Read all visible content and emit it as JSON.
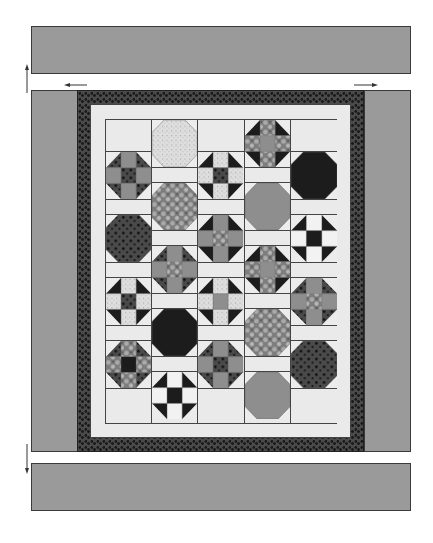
{
  "diagram": {
    "type": "quilt-assembly",
    "colors": {
      "outer_border": "#9a9a9a",
      "dark_border": "#4a4a4a",
      "light_background": "#eaeaea",
      "black": "#1c1c1c",
      "gray": "#8e8e8e",
      "speckle": "#dedede",
      "dotted": "#4a4a4a",
      "floral": "#7d7d7d",
      "line": "#444444"
    },
    "arrows": [
      {
        "name": "arrow-up-left",
        "direction": "up"
      },
      {
        "name": "arrow-left-top",
        "direction": "left"
      },
      {
        "name": "arrow-right-top",
        "direction": "right"
      },
      {
        "name": "arrow-down-left",
        "direction": "down"
      }
    ],
    "columns": [
      {
        "offset": "half",
        "blocks": [
          {
            "type": "shoofly",
            "corners": "dotted",
            "sides": "gray",
            "center": "dotted"
          },
          {
            "type": "octagon",
            "fill": "dotted"
          },
          {
            "type": "shoofly",
            "corners": "black",
            "sides": "speckle",
            "center": "dotted"
          },
          {
            "type": "shoofly",
            "corners": "dotted",
            "sides": "floral",
            "center": "black"
          }
        ]
      },
      {
        "offset": "full",
        "blocks": [
          {
            "type": "octagon",
            "fill": "speckle"
          },
          {
            "type": "octagon",
            "fill": "floral"
          },
          {
            "type": "shoofly",
            "corners": "dotted",
            "sides": "gray",
            "center": "floral"
          },
          {
            "type": "octagon",
            "fill": "black"
          },
          {
            "type": "shoofly",
            "corners": "black",
            "sides": "white",
            "center": "black"
          }
        ]
      },
      {
        "offset": "half",
        "blocks": [
          {
            "type": "shoofly",
            "corners": "black",
            "sides": "speckle",
            "center": "dotted"
          },
          {
            "type": "shoofly",
            "corners": "black",
            "sides": "gray",
            "center": "floral"
          },
          {
            "type": "shoofly",
            "corners": "black",
            "sides": "speckle",
            "center": "gray"
          },
          {
            "type": "shoofly",
            "corners": "dotted",
            "sides": "gray",
            "center": "dotted"
          }
        ]
      },
      {
        "offset": "full",
        "blocks": [
          {
            "type": "shoofly",
            "corners": "black",
            "sides": "floral",
            "center": "gray"
          },
          {
            "type": "octagon",
            "fill": "gray"
          },
          {
            "type": "shoofly",
            "corners": "black",
            "sides": "floral",
            "center": "gray"
          },
          {
            "type": "octagon",
            "fill": "floral"
          },
          {
            "type": "octagon",
            "fill": "gray"
          }
        ]
      },
      {
        "offset": "half",
        "blocks": [
          {
            "type": "octagon",
            "fill": "black"
          },
          {
            "type": "shoofly",
            "corners": "black",
            "sides": "white",
            "center": "black"
          },
          {
            "type": "shoofly",
            "corners": "dotted",
            "sides": "gray",
            "center": "floral"
          },
          {
            "type": "octagon",
            "fill": "dotted"
          }
        ]
      }
    ]
  }
}
